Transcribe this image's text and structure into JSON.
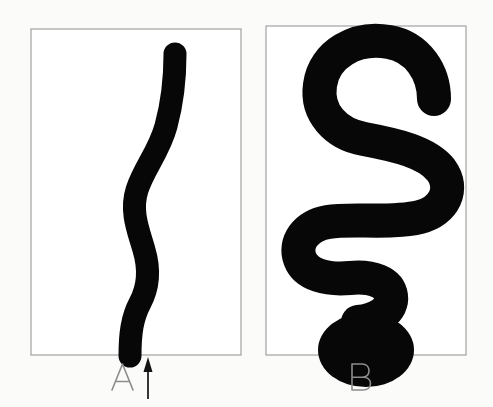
{
  "figure": {
    "background_color": "#fbfbfa",
    "ink_color": "#070707",
    "frame_color": "#9a9a9a",
    "label_color": "#8c8c8c",
    "width": 493,
    "height": 407
  },
  "panels": [
    {
      "id": "panel-a",
      "label": "A",
      "label_x": 122,
      "label_y": 382,
      "frame": {
        "x": 31,
        "y": 29,
        "width": 210,
        "height": 326
      },
      "shape_name": "extended-wavy-filament",
      "has_pointer": true
    },
    {
      "id": "panel-b",
      "label": "B",
      "label_x": 360,
      "label_y": 382,
      "frame": {
        "x": 266,
        "y": 26,
        "width": 200,
        "height": 329
      },
      "shape_name": "coiled-serpentine-filament",
      "has_pointer": false
    }
  ],
  "pointer": {
    "name": "up-arrow-annotation",
    "x": 148,
    "tip_y": 357,
    "tail_y": 399,
    "head_width": 9,
    "head_height": 15,
    "color": "#141414",
    "points_to": "base of filament in panel A"
  },
  "shapes": {
    "panel_a_filament": {
      "stroke_width": 23,
      "path": "M 175 54 C 175 80 172 104 166 126 C 159 152 144 168 137 190 C 130 212 139 232 144 250 C 150 270 148 288 140 303 C 132 318 130 334 130 356",
      "cap": "round"
    },
    "panel_b_filament": {
      "stroke_width": 34,
      "path": "M 434 99 C 434 73 418 47 389 42 C 356 36 324 54 320 85 C 316 113 336 134 364 139 C 396 145 427 152 441 170 C 455 189 444 211 420 217 C 392 224 350 218 328 222 C 305 226 294 243 300 259 C 306 275 327 280 350 278 C 372 276 389 282 391 296 C 393 310 378 320 358 322",
      "cap": "round"
    },
    "panel_b_base_blob": {
      "name": "rounded-base-mass",
      "cx": 366,
      "cy": 350,
      "rx": 48,
      "ry": 37
    }
  }
}
